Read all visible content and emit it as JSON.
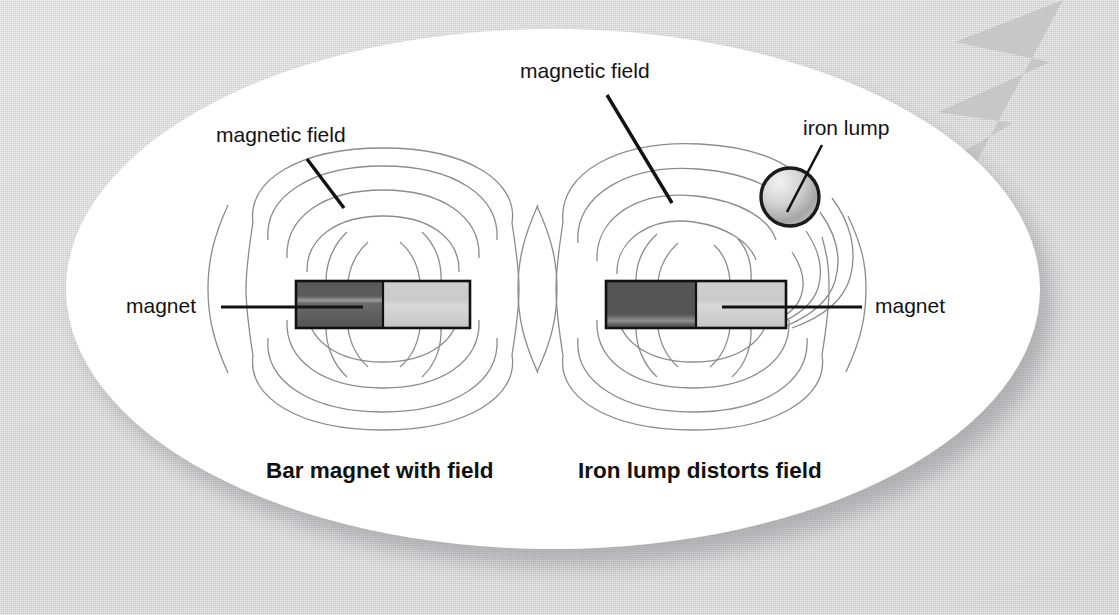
{
  "figure": {
    "title_visible": false,
    "background_color": "#d4d4d4",
    "card_color": "#ffffff",
    "card_shape": "ellipse"
  },
  "decoration": {
    "lightning_bolt": {
      "name": "lightning-bolt-watermark",
      "color": "#c8c8c8"
    }
  },
  "panels": [
    {
      "id": "left",
      "caption": "Bar magnet with field",
      "magnet": {
        "label": "magnet",
        "north_color": "#585858",
        "south_color": "#cbcbcb",
        "outline_color": "#111111"
      },
      "field": {
        "label": "magnetic field",
        "line_color": "#8a8a8a",
        "description": "symmetric dipole loops"
      }
    },
    {
      "id": "right",
      "caption": "Iron lump distorts field",
      "magnet": {
        "label": "magnet",
        "north_color": "#585858",
        "south_color": "#cbcbcb",
        "outline_color": "#111111"
      },
      "field": {
        "label": "magnetic field",
        "line_color": "#8a8a8a",
        "description": "loops bend toward iron lump"
      },
      "iron_lump": {
        "label": "iron lump",
        "fill_light": "#efefef",
        "fill_dark": "#9a9a9a",
        "outline_color": "#1a1a1a"
      }
    }
  ],
  "labels": {
    "left_field": "magnetic field",
    "left_magnet": "magnet",
    "right_field": "magnetic field",
    "right_magnet": "magnet",
    "iron_lump": "iron lump",
    "left_caption": "Bar magnet with field",
    "right_caption": "Iron lump distorts field"
  }
}
